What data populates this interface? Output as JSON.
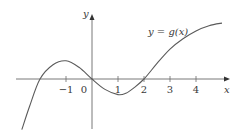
{
  "chart_data": {
    "type": "line",
    "title": "",
    "function_label": "y = g(x)",
    "xlabel": "x",
    "ylabel": "y",
    "x_ticks": [
      -1,
      0,
      1,
      2,
      3,
      4
    ],
    "x_tick_labels": [
      "−1",
      "0",
      "1",
      "2",
      "3",
      "4"
    ],
    "xlim": [
      -3.2,
      5.3
    ],
    "ylim": [
      -2.0,
      2.5
    ],
    "grid": false,
    "legend": "none",
    "series": [
      {
        "name": "g(x)",
        "x": [
          -2.7,
          -2.4,
          -2.0,
          -1.5,
          -1.0,
          -0.5,
          0.0,
          0.5,
          1.0,
          1.3,
          1.6,
          2.0,
          2.5,
          3.0,
          3.5,
          4.0,
          4.5,
          5.0
        ],
        "y": [
          -1.95,
          -1.05,
          0.0,
          0.55,
          0.7,
          0.45,
          0.0,
          -0.4,
          -0.6,
          -0.55,
          -0.35,
          0.0,
          0.6,
          1.15,
          1.55,
          1.85,
          2.05,
          2.15
        ]
      }
    ],
    "annotations": [
      {
        "text": "y = g(x)",
        "x": 2.6,
        "y": 2.0
      }
    ],
    "key_points": {
      "roots": [
        -2,
        0,
        2
      ],
      "local_max": {
        "x": -1,
        "y": 0.7
      },
      "local_min": {
        "x": 1.1,
        "y": -0.6
      }
    }
  },
  "axes": {
    "x_label": "x",
    "y_label": "y",
    "origin_label": "0"
  },
  "colors": {
    "curve": "#5a5a5a",
    "axes": "#6a6a6a",
    "text": "#3a3a3a"
  }
}
